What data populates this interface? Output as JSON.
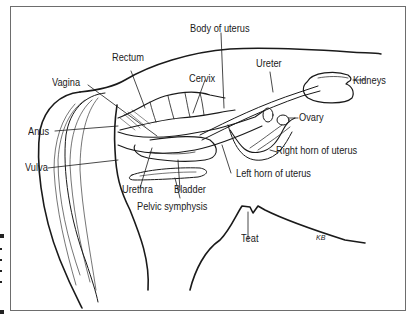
{
  "diagram": {
    "labels": {
      "body_of_uterus": "Body of uterus",
      "rectum": "Rectum",
      "cervix": "Cervix",
      "ureter": "Ureter",
      "kidneys": "Kidneys",
      "vagina": "Vagina",
      "anus": "Anus",
      "ovary": "Ovary",
      "right_horn": "Right horn of uterus",
      "vulva": "Vulva",
      "left_horn": "Left horn of uterus",
      "urethra": "Urethra",
      "bladder": "Bladder",
      "pelvic_symphysis": "Pelvic symphysis",
      "teat": "Teat"
    },
    "signature": "KB",
    "colors": {
      "ink": "#1a1a1a",
      "frame": "#6d6d6d",
      "background": "#ffffff"
    }
  }
}
